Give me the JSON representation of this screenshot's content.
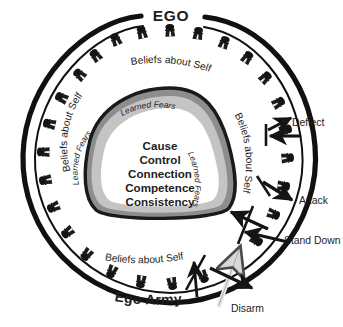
{
  "diagram": {
    "title": "EGO",
    "bottom_title": "Ego Army",
    "core_values": [
      "Cause",
      "Control",
      "Connection",
      "Competence",
      "Consistency"
    ],
    "ring_labels": [
      {
        "text": "Beliefs about Self",
        "position": "top"
      },
      {
        "text": "Beliefs about Self",
        "position": "left"
      },
      {
        "text": "Beliefs about Self",
        "position": "right"
      },
      {
        "text": "Beliefs about Self",
        "position": "bottom"
      }
    ],
    "fear_band_labels": [
      {
        "text": "Learned Fears",
        "position": "top"
      },
      {
        "text": "Learned Fears",
        "position": "left"
      },
      {
        "text": "Learned Fears",
        "position": "right"
      }
    ],
    "actions": [
      {
        "text": "Deflect",
        "arrow": "deflect-arrow"
      },
      {
        "text": "Attack",
        "arrow": "attack-arrow"
      },
      {
        "text": "Stand Down",
        "arrow": "stand-down-arrow"
      },
      {
        "text": "Disarm",
        "arrow": "disarm-arrow"
      }
    ],
    "soldier_icon": "soldier-icon",
    "colors": {
      "ink": "#1a1a1a",
      "band_dark": "#8d8d8d",
      "band_light": "#c9c9c9",
      "core": "#ffffff",
      "disarm_arrow": "#e9e9e9",
      "outline": "#111111"
    }
  }
}
